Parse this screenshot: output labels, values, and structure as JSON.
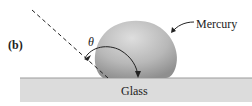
{
  "figure": {
    "part_label": "(b)",
    "angle_symbol": "θ",
    "liquid_label": "Mercury",
    "surface_label": "Glass"
  },
  "colors": {
    "glass_fill": "#dcdcdc",
    "drop_fill": "#b3b3b3",
    "drop_highlight": "#e0e0e0",
    "line": "#222222"
  }
}
